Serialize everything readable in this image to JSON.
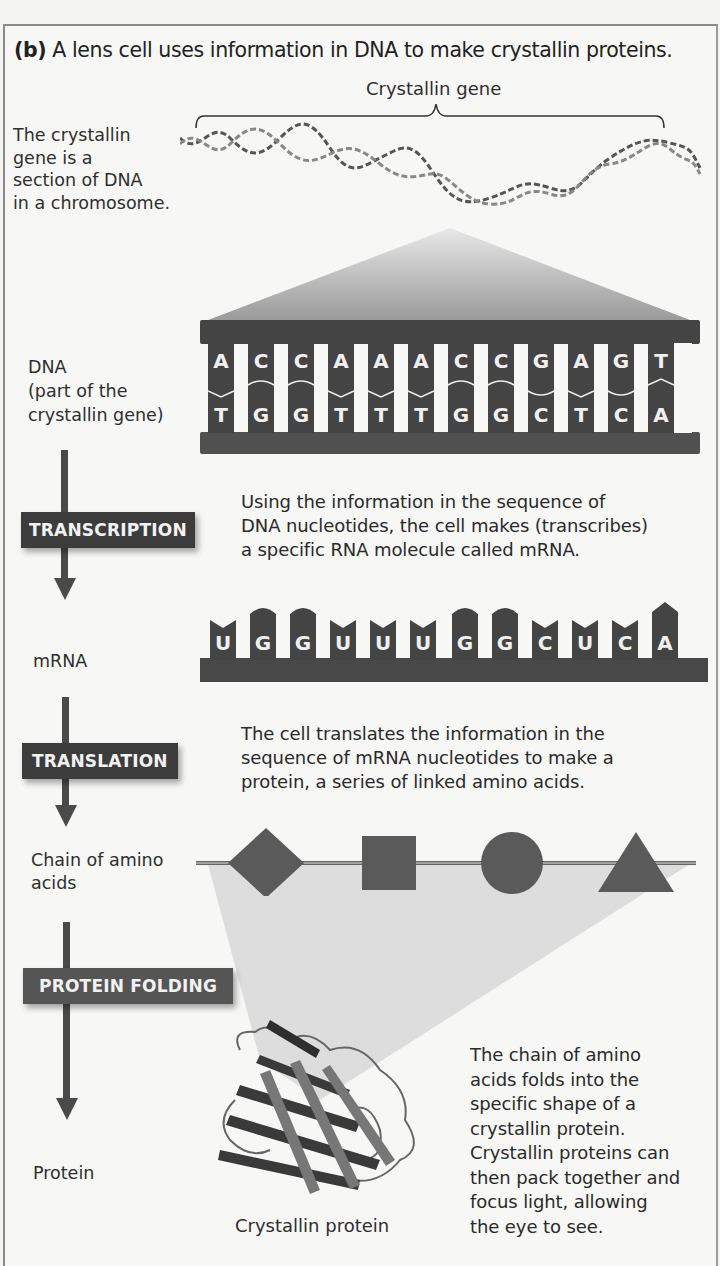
{
  "figure": {
    "title_prefix": "(b)",
    "title_text": " A lens cell uses information in DNA to make crystallin proteins.",
    "gene_bracket_label": "Crystallin gene",
    "chromosome_note": [
      "The crystallin",
      "gene is a",
      "section of DNA",
      "in a chromosome."
    ],
    "dna_label": [
      "DNA",
      "(part of the",
      "crystallin gene)"
    ],
    "dna_top_strand": [
      "A",
      "C",
      "C",
      "A",
      "A",
      "A",
      "C",
      "C",
      "G",
      "A",
      "G",
      "T"
    ],
    "dna_bottom_strand": [
      "T",
      "G",
      "G",
      "T",
      "T",
      "T",
      "G",
      "G",
      "C",
      "T",
      "C",
      "A"
    ],
    "steps": {
      "transcription": {
        "label": "TRANSCRIPTION",
        "description": [
          "Using the information in the sequence of",
          "DNA nucleotides, the cell makes (transcribes)",
          "a specific RNA molecule called mRNA."
        ]
      },
      "translation": {
        "label": "TRANSLATION",
        "description": [
          "The cell translates the information in the",
          "sequence of mRNA nucleotides to make a",
          "protein, a series of linked amino acids."
        ]
      },
      "folding": {
        "label": "PROTEIN FOLDING",
        "description": [
          "The chain of amino",
          "acids folds into the",
          "specific shape of a",
          "crystallin protein.",
          "Crystallin proteins can",
          "then pack together and",
          "focus light, allowing",
          "the eye to see."
        ]
      }
    },
    "mrna_label": "mRNA",
    "mrna_sequence": [
      "U",
      "G",
      "G",
      "U",
      "U",
      "U",
      "G",
      "G",
      "C",
      "U",
      "C",
      "A"
    ],
    "amino_chain_label": [
      "Chain of amino",
      "acids"
    ],
    "amino_shapes": [
      "diamond",
      "square",
      "circle",
      "triangle"
    ],
    "protein_label": "Protein",
    "protein_caption": "Crystallin protein",
    "colors": {
      "dark": "#3c3c3c",
      "mid": "#555555",
      "light_band": "#dcdcdc",
      "bg": "#f7f7f5"
    }
  }
}
